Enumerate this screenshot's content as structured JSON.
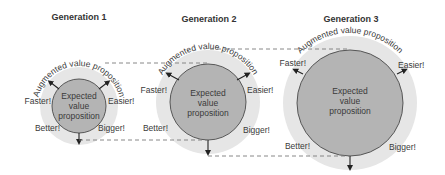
{
  "colors": {
    "halo": "#e6e6e6",
    "inner": "#b4b4b4",
    "inner_stroke": "#4a4a4a",
    "text": "#333333",
    "dash": "#7a7a7a"
  },
  "generations": [
    {
      "title": "Generation 1",
      "augmented_label": "Augmented value proposition",
      "expected_lines": [
        "Expected",
        "value",
        "proposition"
      ],
      "labels": {
        "faster": "Faster!",
        "easier": "Easier!",
        "better": "Better!",
        "bigger": "Bigger!"
      }
    },
    {
      "title": "Generation 2",
      "augmented_label": "Augmented value proposition",
      "expected_lines": [
        "Expected",
        "value",
        "proposition"
      ],
      "labels": {
        "faster": "Faster!",
        "easier": "Easier!",
        "better": "Better!",
        "bigger": "Bigger!"
      }
    },
    {
      "title": "Generation 3",
      "augmented_label": "Augmented value proposition",
      "expected_lines": [
        "Expected",
        "value",
        "proposition"
      ],
      "labels": {
        "faster": "Faster!",
        "easier": "Easier!",
        "better": "Better!",
        "bigger": "Bigger!"
      }
    }
  ]
}
